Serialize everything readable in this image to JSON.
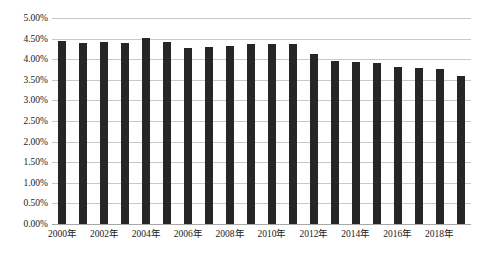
{
  "chart_data": {
    "type": "bar",
    "title": "",
    "subtitle": "",
    "xlabel": "",
    "ylabel": "",
    "grid": true,
    "legend": false,
    "ylim": [
      0,
      5
    ],
    "y_tick_labels": [
      "5.00%",
      "4.50%",
      "4.00%",
      "3.50%",
      "3.00%",
      "2.50%",
      "2.00%",
      "1.50%",
      "1.00%",
      "0.50%",
      "0.00%"
    ],
    "y_tick_values": [
      5.0,
      4.5,
      4.0,
      3.5,
      3.0,
      2.5,
      2.0,
      1.5,
      1.0,
      0.5,
      0.0
    ],
    "categories": [
      "2000年",
      "2001年",
      "2002年",
      "2003年",
      "2004年",
      "2005年",
      "2006年",
      "2007年",
      "2008年",
      "2009年",
      "2010年",
      "2011年",
      "2012年",
      "2013年",
      "2014年",
      "2015年",
      "2016年",
      "2017年",
      "2018年",
      "2019年"
    ],
    "x_tick_labels": [
      "2000年",
      "2002年",
      "2004年",
      "2006年",
      "2008年",
      "2010年",
      "2012年",
      "2014年",
      "2016年",
      "2018年"
    ],
    "x_tick_indices": [
      0,
      2,
      4,
      6,
      8,
      10,
      12,
      14,
      16,
      18
    ],
    "values": [
      4.44,
      4.4,
      4.42,
      4.4,
      4.52,
      4.42,
      4.28,
      4.3,
      4.32,
      4.38,
      4.36,
      4.36,
      4.12,
      3.96,
      3.94,
      3.92,
      3.8,
      3.78,
      3.76,
      3.6
    ],
    "value_labels": [
      "4.44%",
      "4.40%",
      "4.42%",
      "4.40%",
      "4.52%",
      "4.42%",
      "4.28%",
      "4.30%",
      "4.32%",
      "4.38%",
      "4.36%",
      "4.36%",
      "4.12%",
      "3.96%",
      "3.94%",
      "3.92%",
      "3.80%",
      "3.78%",
      "3.76%",
      "3.60%"
    ],
    "colors": {
      "bar": "#262626",
      "grid": "#c8c8c8",
      "axis": "#a8a8a8",
      "text": "#1a1a1a",
      "background": "#ffffff"
    }
  }
}
